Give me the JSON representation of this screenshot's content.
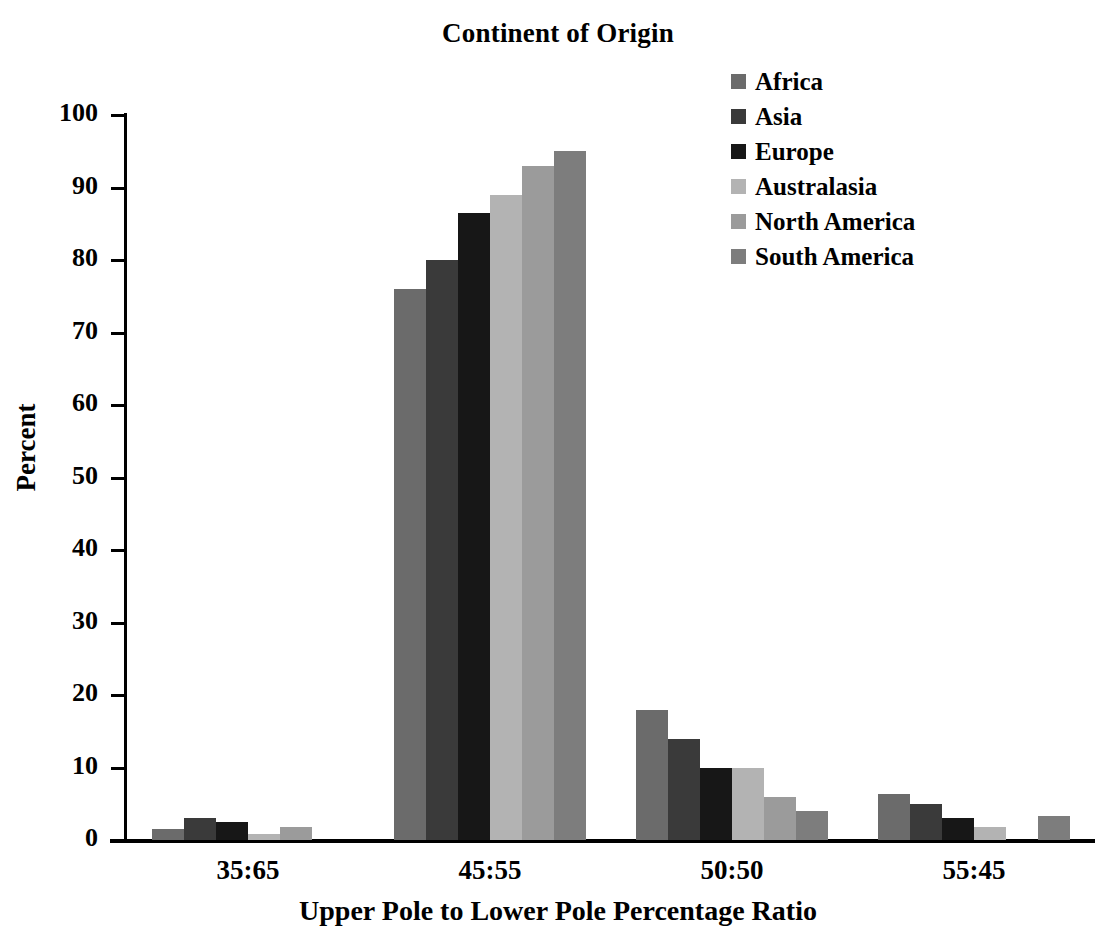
{
  "chart_data": {
    "type": "bar",
    "title": "Continent of Origin",
    "xlabel": "Upper Pole to Lower Pole Percentage Ratio",
    "ylabel": "Percent",
    "categories": [
      "35:65",
      "45:55",
      "50:50",
      "55:45"
    ],
    "ylim": [
      0,
      100
    ],
    "yticks": [
      0,
      10,
      20,
      30,
      40,
      50,
      60,
      70,
      80,
      90,
      100
    ],
    "grid": false,
    "legend_position": "top-right",
    "series": [
      {
        "name": "Africa",
        "color": "#6b6b6b",
        "values": [
          1.5,
          76,
          18,
          6.3
        ]
      },
      {
        "name": "Asia",
        "color": "#3a3a3a",
        "values": [
          3.0,
          80,
          14,
          5.0
        ]
      },
      {
        "name": "Europe",
        "color": "#171717",
        "values": [
          2.5,
          86.5,
          10,
          3.0
        ]
      },
      {
        "name": "Australasia",
        "color": "#b3b3b3",
        "values": [
          0.8,
          89,
          10,
          1.8
        ]
      },
      {
        "name": "North America",
        "color": "#9b9b9b",
        "values": [
          1.8,
          93,
          6,
          0.0
        ]
      },
      {
        "name": "South America",
        "color": "#7d7d7d",
        "values": [
          0.0,
          95,
          4,
          3.3
        ]
      }
    ]
  }
}
